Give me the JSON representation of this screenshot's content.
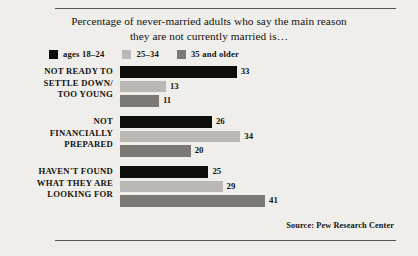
{
  "chart_data": {
    "type": "bar",
    "orientation": "horizontal",
    "title": "Percentage of never-married adults who say the main reason they are not currently married is…",
    "title_lines": [
      "Percentage of never-married adults who say the main reason",
      "they are not currently married is…"
    ],
    "xlabel": "",
    "ylabel": "",
    "xlim": [
      0,
      41
    ],
    "grid": false,
    "legend_position": "top-left",
    "categories": [
      "NOT READY TO SETTLE DOWN/ TOO YOUNG",
      "NOT FINANCIALLY PREPARED",
      "HAVEN'T FOUND WHAT THEY ARE LOOKING FOR"
    ],
    "category_lines": [
      [
        "NOT READY TO",
        "SETTLE DOWN/",
        "TOO YOUNG"
      ],
      [
        "NOT",
        "FINANCIALLY",
        "PREPARED"
      ],
      [
        "HAVEN'T FOUND",
        "WHAT THEY ARE",
        "LOOKING FOR"
      ]
    ],
    "series": [
      {
        "name": "ages 18–24",
        "color": "#0d0d0c",
        "values": [
          33,
          26,
          25
        ]
      },
      {
        "name": "25–34",
        "color": "#b9b8b4",
        "values": [
          13,
          34,
          29
        ]
      },
      {
        "name": "35 and older",
        "color": "#7a7975",
        "values": [
          11,
          20,
          41
        ]
      }
    ],
    "source": "Source:  Pew Research Center"
  },
  "legend": {
    "items": [
      {
        "label": "ages 18–24",
        "color": "#0d0d0c"
      },
      {
        "label": "25–34",
        "color": "#b9b8b4"
      },
      {
        "label": "35 and older",
        "color": "#7a7975"
      }
    ]
  },
  "colors": {
    "background": "#efeeea",
    "rule": "#56544f",
    "text": "#15130f"
  }
}
